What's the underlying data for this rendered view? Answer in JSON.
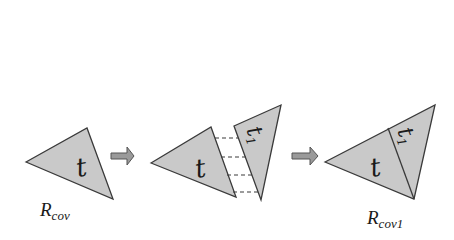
{
  "diagram": {
    "colors": {
      "triangle_fill": "#c9c9c9",
      "stroke": "#3a3a3a",
      "arrow_fill": "#9a9a9a",
      "background": "#ffffff"
    },
    "stage1": {
      "triangle_label": "t",
      "region_label_main": "R",
      "region_label_sub": "cov"
    },
    "arrow1": {
      "icon": "right-block-arrow"
    },
    "stage2": {
      "triangle_label": "t",
      "neighbor_label_main": "t",
      "neighbor_label_sub": "1",
      "connector_count": 4
    },
    "arrow2": {
      "icon": "right-block-arrow"
    },
    "stage3": {
      "triangle_label": "t",
      "neighbor_label_main": "t",
      "neighbor_label_sub": "1",
      "region_label_main": "R",
      "region_label_sub": "cov1"
    }
  }
}
